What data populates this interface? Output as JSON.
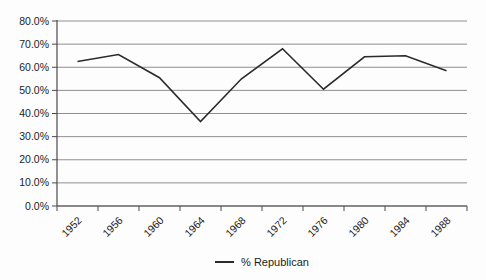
{
  "chart_data": {
    "type": "line",
    "title": "",
    "xlabel": "",
    "ylabel": "",
    "categories": [
      "1952",
      "1956",
      "1960",
      "1964",
      "1968",
      "1972",
      "1976",
      "1980",
      "1984",
      "1988"
    ],
    "series": [
      {
        "name": "% Republican",
        "values": [
          62.5,
          65.5,
          55.5,
          36.5,
          55.0,
          68.0,
          50.5,
          64.5,
          65.0,
          58.5
        ]
      }
    ],
    "ylim": [
      0,
      80
    ],
    "ytick_step": 10,
    "ytick_labels": [
      "0.0%",
      "10.0%",
      "20.0%",
      "30.0%",
      "40.0%",
      "50.0%",
      "60.0%",
      "70.0%",
      "80.0%"
    ],
    "grid": true,
    "legend_position": "bottom-center",
    "colors": {
      "line": "#2b2b2b",
      "gridline": "#8f8f8f",
      "axis": "#4a4a4a",
      "text": "#1c1c1c",
      "background": "#fdfdfd"
    }
  }
}
